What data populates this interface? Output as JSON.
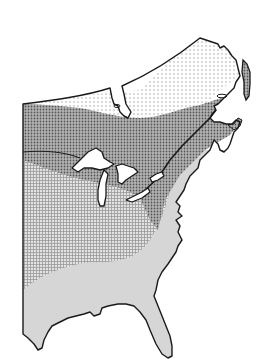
{
  "map": {
    "subject": "Eastern North America range map",
    "style": "black-and-white stippled halftone",
    "background_color": "#ffffff",
    "outline_color": "#1a1a1a",
    "zones": [
      {
        "name": "northern-zone",
        "pattern": "dense dots",
        "color": "#8f8f8f",
        "region": "southern Canada, Great Lakes, New England, Maritimes"
      },
      {
        "name": "central-zone",
        "pattern": "fine grid",
        "color": "#c4c4c4",
        "region": "central and eastern United States interior"
      },
      {
        "name": "southern-zone",
        "pattern": "flat light gray",
        "color": "#d6d6d6",
        "region": "Gulf coast, Florida, southeastern coastal plain"
      },
      {
        "name": "unshaded-zone",
        "pattern": "none",
        "color": "#ffffff",
        "region": "northern Quebec and Labrador"
      }
    ],
    "features": [
      "Great Lakes",
      "James Bay",
      "Gulf of St. Lawrence",
      "Newfoundland",
      "Nova Scotia",
      "Florida peninsula",
      "Gulf of Mexico coast",
      "Atlantic coast"
    ]
  }
}
